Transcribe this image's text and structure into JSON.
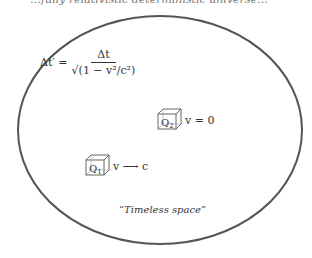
{
  "header_cut_text": "…fully relativistic deterministic universe…",
  "formula": {
    "lhs": "Δt′ =",
    "numerator": "Δt",
    "denominator": "√(1 − v²/c²)"
  },
  "particles": [
    {
      "label": "Q",
      "subscript": "2",
      "velocity_label": "v = 0"
    },
    {
      "label": "Q",
      "subscript": "1",
      "velocity_label": "v ⟶ c"
    }
  ],
  "caption": "“Timeless space”",
  "colors": {
    "outline": "#555555",
    "text": "#333333"
  }
}
